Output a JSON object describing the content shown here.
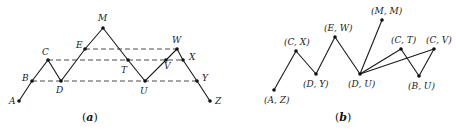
{
  "panel_a": {
    "caption": "(a)",
    "caption_letter": "a",
    "points": [
      {
        "id": "A",
        "label": "A",
        "x": 19,
        "y": 101,
        "lx": 9,
        "ly": 104
      },
      {
        "id": "B",
        "label": "B",
        "x": 32,
        "y": 81,
        "lx": 22,
        "ly": 81
      },
      {
        "id": "C",
        "label": "C",
        "x": 48,
        "y": 60,
        "lx": 42,
        "ly": 55
      },
      {
        "id": "D",
        "label": "D",
        "x": 61,
        "y": 81,
        "lx": 56,
        "ly": 93
      },
      {
        "id": "E",
        "label": "E",
        "x": 85,
        "y": 49,
        "lx": 76,
        "ly": 48
      },
      {
        "id": "M",
        "label": "M",
        "x": 103,
        "y": 28,
        "lx": 98,
        "ly": 21
      },
      {
        "id": "T",
        "label": "T",
        "x": 128,
        "y": 60,
        "lx": 121,
        "ly": 73
      },
      {
        "id": "U",
        "label": "U",
        "x": 145,
        "y": 81,
        "lx": 140,
        "ly": 94
      },
      {
        "id": "V",
        "label": "V",
        "x": 166,
        "y": 60,
        "lx": 164,
        "ly": 69
      },
      {
        "id": "W",
        "label": "W",
        "x": 177,
        "y": 49,
        "lx": 172,
        "ly": 43
      },
      {
        "id": "X",
        "label": "X",
        "x": 183,
        "y": 60,
        "lx": 189,
        "ly": 60
      },
      {
        "id": "Y",
        "label": "Y",
        "x": 197,
        "y": 81,
        "lx": 202,
        "ly": 81
      },
      {
        "id": "Z",
        "label": "Z",
        "x": 210,
        "y": 101,
        "lx": 215,
        "ly": 104
      }
    ],
    "path": [
      "A",
      "B",
      "C",
      "D",
      "E",
      "M",
      "T",
      "U",
      "V",
      "W",
      "X",
      "Y",
      "Z"
    ],
    "dashed_lines": [
      [
        "E",
        "W"
      ],
      [
        "C",
        "X"
      ],
      [
        "B",
        "Y"
      ]
    ]
  },
  "panel_b": {
    "caption": "(b)",
    "caption_letter": "b",
    "nodes": [
      {
        "id": "AZ",
        "label": "(A, Z)",
        "x": 274,
        "y": 90,
        "lx": 264,
        "ly": 103
      },
      {
        "id": "CX",
        "label": "(C, X)",
        "x": 296,
        "y": 51,
        "lx": 284,
        "ly": 45
      },
      {
        "id": "DY",
        "label": "(D, Y)",
        "x": 316,
        "y": 74,
        "lx": 303,
        "ly": 87
      },
      {
        "id": "EW",
        "label": "(E, W)",
        "x": 335,
        "y": 37,
        "lx": 324,
        "ly": 31
      },
      {
        "id": "DU",
        "label": "(D, U)",
        "x": 360,
        "y": 74,
        "lx": 348,
        "ly": 87
      },
      {
        "id": "MM",
        "label": "(M, M)",
        "x": 382,
        "y": 20,
        "lx": 371,
        "ly": 14
      },
      {
        "id": "CT",
        "label": "(C, T)",
        "x": 401,
        "y": 49,
        "lx": 391,
        "ly": 43
      },
      {
        "id": "BU",
        "label": "(B, U)",
        "x": 419,
        "y": 76,
        "lx": 408,
        "ly": 89
      },
      {
        "id": "CV",
        "label": "(C, V)",
        "x": 434,
        "y": 49,
        "lx": 426,
        "ly": 43
      }
    ],
    "edges": [
      [
        "AZ",
        "CX"
      ],
      [
        "CX",
        "DY"
      ],
      [
        "DY",
        "EW"
      ],
      [
        "EW",
        "DU"
      ],
      [
        "DU",
        "MM"
      ],
      [
        "DU",
        "CT"
      ],
      [
        "DU",
        "CV"
      ],
      [
        "CT",
        "BU"
      ],
      [
        "BU",
        "CV"
      ]
    ]
  }
}
